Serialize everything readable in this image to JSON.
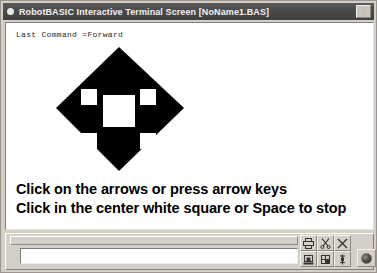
{
  "window": {
    "title": "RobotBASIC Interactive Terminal Screen  [NoName1.BAS]",
    "close_label": "close-icon",
    "titlebar_bg": "#4a4a4a",
    "titlebar_fg": "#f2f2f2",
    "chrome_bg": "#d4d0c8"
  },
  "terminal": {
    "last_command_line": "Last Command =Forward",
    "background": "#ffffff",
    "instructions": [
      "Click on the arrows or press arrow keys",
      "Click in the center white square or Space to stop"
    ]
  },
  "graphic": {
    "name": "direction-pad-diamond",
    "shape": "diamond",
    "fill_color": "#000000",
    "square_color": "#ffffff",
    "center_square_label": "stop",
    "corner_square_labels": [
      "up-left-arrow",
      "up-right-arrow",
      "down-left-arrow",
      "down-right-arrow"
    ]
  },
  "bottom_panel": {
    "command_input": {
      "value": "",
      "placeholder": ""
    },
    "buttons": [
      {
        "name": "print-button",
        "icon": "printer-icon",
        "label": "Print"
      },
      {
        "name": "cut-button",
        "icon": "scissors-icon",
        "label": "Cut"
      },
      {
        "name": "close-screen-button",
        "icon": "x-icon",
        "label": "Close"
      },
      {
        "name": "save-button",
        "icon": "save-icon",
        "label": "Save"
      },
      {
        "name": "open-button",
        "icon": "folder-icon",
        "label": "Open"
      },
      {
        "name": "paste-button",
        "icon": "pin-icon",
        "label": "Paste"
      }
    ],
    "round_button": {
      "name": "power-button",
      "icon": "circle-icon",
      "label": "Options"
    }
  }
}
